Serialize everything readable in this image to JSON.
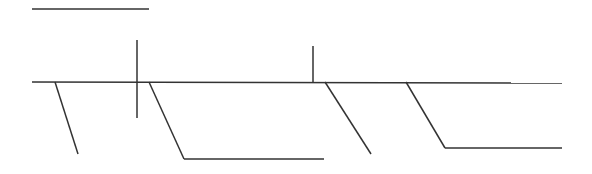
{
  "diagram": {
    "background": "#ffffff",
    "stroke_color": "#333333",
    "stroke_width": 1.5,
    "segments": [
      {
        "name": "top-bar-line",
        "x1": 32,
        "y1": 9,
        "x2": 149,
        "y2": 9
      },
      {
        "name": "main-horizontal-line",
        "x1": 32,
        "y1": 82,
        "x2": 562,
        "y2": 83
      },
      {
        "name": "tall-vertical-tick",
        "x1": 137,
        "y1": 40,
        "x2": 137,
        "y2": 118
      },
      {
        "name": "short-vertical-tick",
        "x1": 313,
        "y1": 46,
        "x2": 313,
        "y2": 82
      },
      {
        "name": "branch-1-diagonal",
        "x1": 55,
        "y1": 82,
        "x2": 78,
        "y2": 154
      },
      {
        "name": "branch-2-diagonal",
        "x1": 149,
        "y1": 82,
        "x2": 184,
        "y2": 159
      },
      {
        "name": "branch-2-horizontal",
        "x1": 184,
        "y1": 159,
        "x2": 324,
        "y2": 159
      },
      {
        "name": "branch-3-diagonal",
        "x1": 325,
        "y1": 82,
        "x2": 371,
        "y2": 154
      },
      {
        "name": "branch-4-diagonal",
        "x1": 406,
        "y1": 82,
        "x2": 445,
        "y2": 148
      },
      {
        "name": "branch-4-horizontal",
        "x1": 445,
        "y1": 148,
        "x2": 562,
        "y2": 148
      }
    ]
  }
}
